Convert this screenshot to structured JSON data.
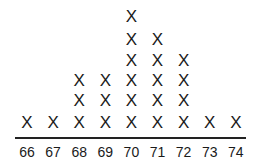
{
  "chart_data": {
    "type": "dot-plot",
    "title": "",
    "xlabel": "",
    "ylabel": "",
    "marker": "X",
    "categories": [
      "66",
      "67",
      "68",
      "69",
      "70",
      "71",
      "72",
      "73",
      "74"
    ],
    "values": [
      1,
      1,
      3,
      3,
      6,
      5,
      4,
      1,
      1
    ],
    "xlim": [
      66,
      74
    ],
    "grid": false
  }
}
